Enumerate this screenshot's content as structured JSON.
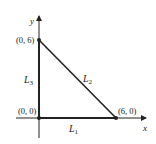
{
  "diagram": {
    "axes": {
      "x_label": "x",
      "y_label": "y"
    },
    "points": [
      {
        "label": "(0, 6)",
        "x": 0,
        "y": 6
      },
      {
        "label": "(0, 0)",
        "x": 0,
        "y": 0
      },
      {
        "label": "(6, 0)",
        "x": 6,
        "y": 0
      }
    ],
    "segments": [
      {
        "name": "L",
        "sub": "1",
        "from": "(0, 0)",
        "to": "(6, 0)"
      },
      {
        "name": "L",
        "sub": "2",
        "from": "(0, 6)",
        "to": "(6, 0)"
      },
      {
        "name": "L",
        "sub": "3",
        "from": "(0, 0)",
        "to": "(0, 6)"
      }
    ],
    "colors": {
      "line": "#222222",
      "background": "#ffffff"
    }
  }
}
